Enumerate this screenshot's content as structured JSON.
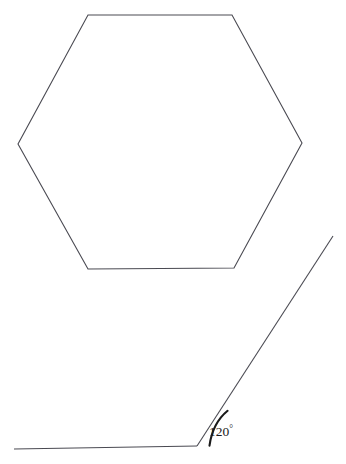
{
  "figure": {
    "background_color": "#ffffff",
    "line_color": "#4a4a52",
    "arc_color": "#1a1a1a",
    "label_color": "#1a1a1a",
    "shapes": {
      "hexagon": {
        "name": "regular-hexagon",
        "sides": 6,
        "points": "88,15 232,15 302,143 234,268 88,269 18,144"
      },
      "angle_figure": {
        "name": "exterior-angle-illustration",
        "vertex": {
          "x": 197,
          "y": 446
        },
        "horizontal_ray": {
          "x1": 14,
          "y1": 449,
          "x2": 197,
          "y2": 446
        },
        "oblique_ray": {
          "x1": 197,
          "y1": 446,
          "x2": 333,
          "y2": 236
        },
        "arc_path": "M 209.5,445.6 C 211.5,431.0 217.0,419.5 227.6,410.8"
      }
    }
  },
  "labels": {
    "angle_value": "120",
    "angle_degree_symbol": "°",
    "angle_label_x": 221,
    "angle_label_y": 436
  }
}
